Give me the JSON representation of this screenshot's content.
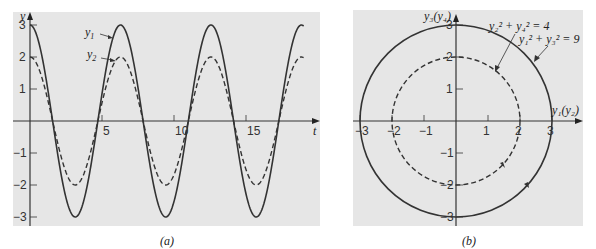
{
  "chart_data": [
    {
      "panel": "a",
      "type": "line",
      "caption": "(a)",
      "xlabel": "t",
      "ylabel": "y",
      "xlim": [
        -1.2,
        20
      ],
      "ylim": [
        -3.2,
        3.3
      ],
      "xticks": [
        5,
        10,
        15
      ],
      "yticks": [
        -3,
        -2,
        -1,
        1,
        2,
        3
      ],
      "grid": false,
      "series": [
        {
          "name": "y1",
          "label": "y₁",
          "style": "solid",
          "formula": "3cos(t)",
          "amplitude": 3
        },
        {
          "name": "y2",
          "label": "y₂",
          "style": "dashed",
          "formula": "2cos(t)",
          "amplitude": 2
        }
      ],
      "t_range": [
        0,
        19
      ]
    },
    {
      "panel": "b",
      "type": "line",
      "caption": "(b)",
      "xlabel": "y₁(y₂)",
      "ylabel": "y₃(y₄)",
      "xlim": [
        -3.3,
        3.8
      ],
      "ylim": [
        -3.3,
        3.5
      ],
      "xticks": [
        -3,
        -2,
        -1,
        1,
        2,
        3
      ],
      "yticks": [
        -3,
        -2,
        -1,
        1,
        2,
        3
      ],
      "grid": false,
      "series": [
        {
          "name": "outer",
          "label": "y₁² + y₃² = 9",
          "style": "solid",
          "radius": 3
        },
        {
          "name": "inner",
          "label": "y₂² + y₄² = 4",
          "style": "dashed",
          "radius": 2
        }
      ],
      "annotations": [
        "y₂² + y₄² = 4",
        "y₁² + y₃² = 9"
      ]
    }
  ],
  "labels": {
    "a": {
      "y": "y",
      "t": "t",
      "y1": "y",
      "y1_sub": "1",
      "y2": "y",
      "y2_sub": "2",
      "caption": "(a)",
      "xticks": [
        "5",
        "10",
        "15"
      ],
      "yticks": [
        "3",
        "2",
        "1",
        "−1",
        "−2",
        "−3"
      ]
    },
    "b": {
      "yaxis": "y₃(y₄)",
      "xaxis": "y₁(y₂)",
      "eq_inner": "y₂² + y₄² = 4",
      "eq_outer": "y₁² + y₃² = 9",
      "caption": "(b)",
      "xticks": [
        "−3",
        "−2",
        "−1",
        "1",
        "2",
        "3"
      ],
      "yticks": [
        "3",
        "2",
        "1",
        "−1",
        "−2",
        "−3"
      ]
    }
  },
  "colors": {
    "panel_bg": "#e6e6e6",
    "curve": "#333333",
    "axis": "#333333"
  }
}
